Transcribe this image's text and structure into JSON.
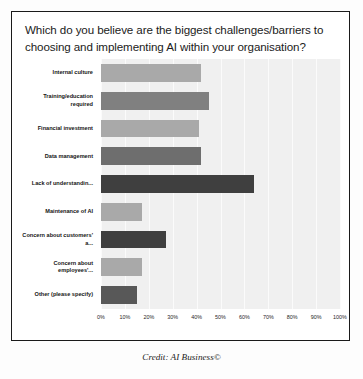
{
  "figure": {
    "title": "Which do you believe are the biggest challenges/barriers to choosing and implementing AI within your organisation?",
    "caption": "Credit: AI Business©"
  },
  "chart_data": {
    "type": "bar",
    "orientation": "horizontal",
    "title": "Which do you believe are the biggest challenges/barriers to choosing and implementing AI within your organisation?",
    "xlabel": "",
    "ylabel": "",
    "xlim": [
      0,
      100
    ],
    "grid": true,
    "legend": "none",
    "categories": [
      "Internal culture",
      "Training/education required",
      "Financial investment",
      "Data management",
      "Lack of understandin...",
      "Maintenance of AI",
      "Concern about customers' a...",
      "Concern about employees'...",
      "Other (please specify)"
    ],
    "values": [
      42,
      45,
      41,
      42,
      64,
      17,
      27,
      17,
      15
    ],
    "colors": [
      "#a9a9a9",
      "#808080",
      "#a9a9a9",
      "#6e6e6e",
      "#3f3f3f",
      "#a9a9a9",
      "#3f3f3f",
      "#a9a9a9",
      "#585858"
    ],
    "xticks": [
      "0%",
      "10%",
      "20%",
      "30%",
      "40%",
      "50%",
      "60%",
      "70%",
      "80%",
      "90%",
      "100%"
    ],
    "xtick_values": [
      0,
      10,
      20,
      30,
      40,
      50,
      60,
      70,
      80,
      90,
      100
    ],
    "plot_background": "#f0f0f0"
  }
}
